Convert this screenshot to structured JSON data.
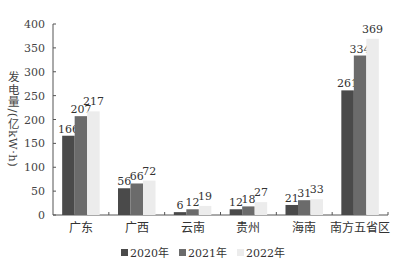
{
  "chart_data": {
    "type": "bar",
    "title": "",
    "xlabel": "",
    "ylabel": "发电量/(亿kW·h)",
    "ylim": [
      0,
      400
    ],
    "yticks": [
      0,
      50,
      100,
      150,
      200,
      250,
      300,
      350,
      400
    ],
    "categories": [
      "广东",
      "广西",
      "云南",
      "贵州",
      "海南",
      "南方五省区"
    ],
    "series": [
      {
        "name": "2020年",
        "color": "#4a4a4a",
        "values": [
          166,
          56,
          6,
          12,
          21,
          261
        ]
      },
      {
        "name": "2021年",
        "color": "#6b6b6b",
        "values": [
          207,
          66,
          12,
          18,
          31,
          334
        ]
      },
      {
        "name": "2022年",
        "color": "#ececec",
        "values": [
          217,
          72,
          19,
          27,
          33,
          369
        ]
      }
    ],
    "grid": false,
    "legend_position": "bottom",
    "data_labels": true
  }
}
